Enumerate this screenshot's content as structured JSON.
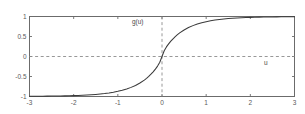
{
  "chart_data": {
    "type": "line",
    "title": "",
    "subtitle": "",
    "xlabel": "u",
    "ylabel": "g(u)",
    "xlim": [
      -3,
      3
    ],
    "ylim": [
      -1,
      1
    ],
    "grid": false,
    "legend": null,
    "xticks": [
      -3,
      -2,
      -1,
      0,
      1,
      2,
      3
    ],
    "xticklabels": [
      "-3",
      "-2",
      "-1",
      "0",
      "1",
      "2",
      "3"
    ],
    "yticks": [
      -1,
      -0.5,
      0,
      0.5,
      1
    ],
    "yticklabels": [
      "-1",
      "-0.5",
      "0",
      "0.5",
      "1"
    ],
    "annotations": [
      {
        "text": "g(u)",
        "x": -0.55,
        "y": 0.86
      },
      {
        "text": "u",
        "x": 2.35,
        "y": -0.17
      }
    ],
    "reference_lines": [
      {
        "orientation": "horizontal",
        "value": 0,
        "style": "dashed",
        "color": "#8c8c8c"
      },
      {
        "orientation": "vertical",
        "value": 0,
        "style": "dashed",
        "color": "#8c8c8c"
      }
    ],
    "series": [
      {
        "name": "g(u)",
        "color": "#3a3a3a",
        "style": "solid",
        "x": [
          -3,
          -2.9,
          -2.8,
          -2.7,
          -2.6,
          -2.5,
          -2.4,
          -2.3,
          -2.2,
          -2.1,
          -2,
          -1.9,
          -1.8,
          -1.7,
          -1.6,
          -1.5,
          -1.4,
          -1.3,
          -1.2,
          -1.1,
          -1,
          -0.9,
          -0.8,
          -0.7,
          -0.6,
          -0.5,
          -0.4,
          -0.35,
          -0.3,
          -0.25,
          -0.2,
          -0.15,
          -0.1,
          -0.05,
          0,
          0.05,
          0.1,
          0.15,
          0.2,
          0.25,
          0.3,
          0.35,
          0.4,
          0.5,
          0.6,
          0.7,
          0.8,
          0.9,
          1,
          1.1,
          1.2,
          1.3,
          1.4,
          1.5,
          1.6,
          1.7,
          1.8,
          1.9,
          2,
          2.1,
          2.2,
          2.3,
          2.4,
          2.5,
          2.6,
          2.7,
          2.8,
          2.9,
          3
        ],
        "y": [
          -0.995,
          -0.994,
          -0.993,
          -0.992,
          -0.991,
          -0.99,
          -0.988,
          -0.986,
          -0.984,
          -0.981,
          -0.978,
          -0.974,
          -0.969,
          -0.963,
          -0.956,
          -0.948,
          -0.938,
          -0.926,
          -0.911,
          -0.893,
          -0.871,
          -0.845,
          -0.812,
          -0.772,
          -0.724,
          -0.664,
          -0.59,
          -0.546,
          -0.497,
          -0.443,
          -0.383,
          -0.315,
          -0.24,
          -0.145,
          0,
          0.145,
          0.24,
          0.315,
          0.383,
          0.443,
          0.497,
          0.546,
          0.59,
          0.664,
          0.724,
          0.772,
          0.812,
          0.845,
          0.871,
          0.893,
          0.911,
          0.926,
          0.938,
          0.948,
          0.956,
          0.963,
          0.969,
          0.974,
          0.978,
          0.981,
          0.984,
          0.986,
          0.988,
          0.99,
          0.991,
          0.992,
          0.993,
          0.994,
          0.995
        ]
      }
    ]
  },
  "figure": {
    "background_color": "#ffffff",
    "axes_color": "#6b6b6b",
    "curve_color": "#3a3a3a",
    "dash_color": "#8c8c8c",
    "tick_label_color": "#5a5a5a"
  }
}
